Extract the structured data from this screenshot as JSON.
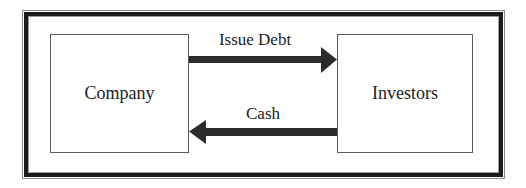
{
  "diagram": {
    "nodes": [
      {
        "id": "company",
        "label": "Company"
      },
      {
        "id": "investors",
        "label": "Investors"
      }
    ],
    "edges": [
      {
        "from": "company",
        "to": "investors",
        "label": "Issue Debt"
      },
      {
        "from": "investors",
        "to": "company",
        "label": "Cash"
      }
    ],
    "colors": {
      "arrow": "#2b2b2b",
      "frame": "#1a1a1a",
      "box_border": "#5a5a5a",
      "text": "#222222"
    }
  }
}
